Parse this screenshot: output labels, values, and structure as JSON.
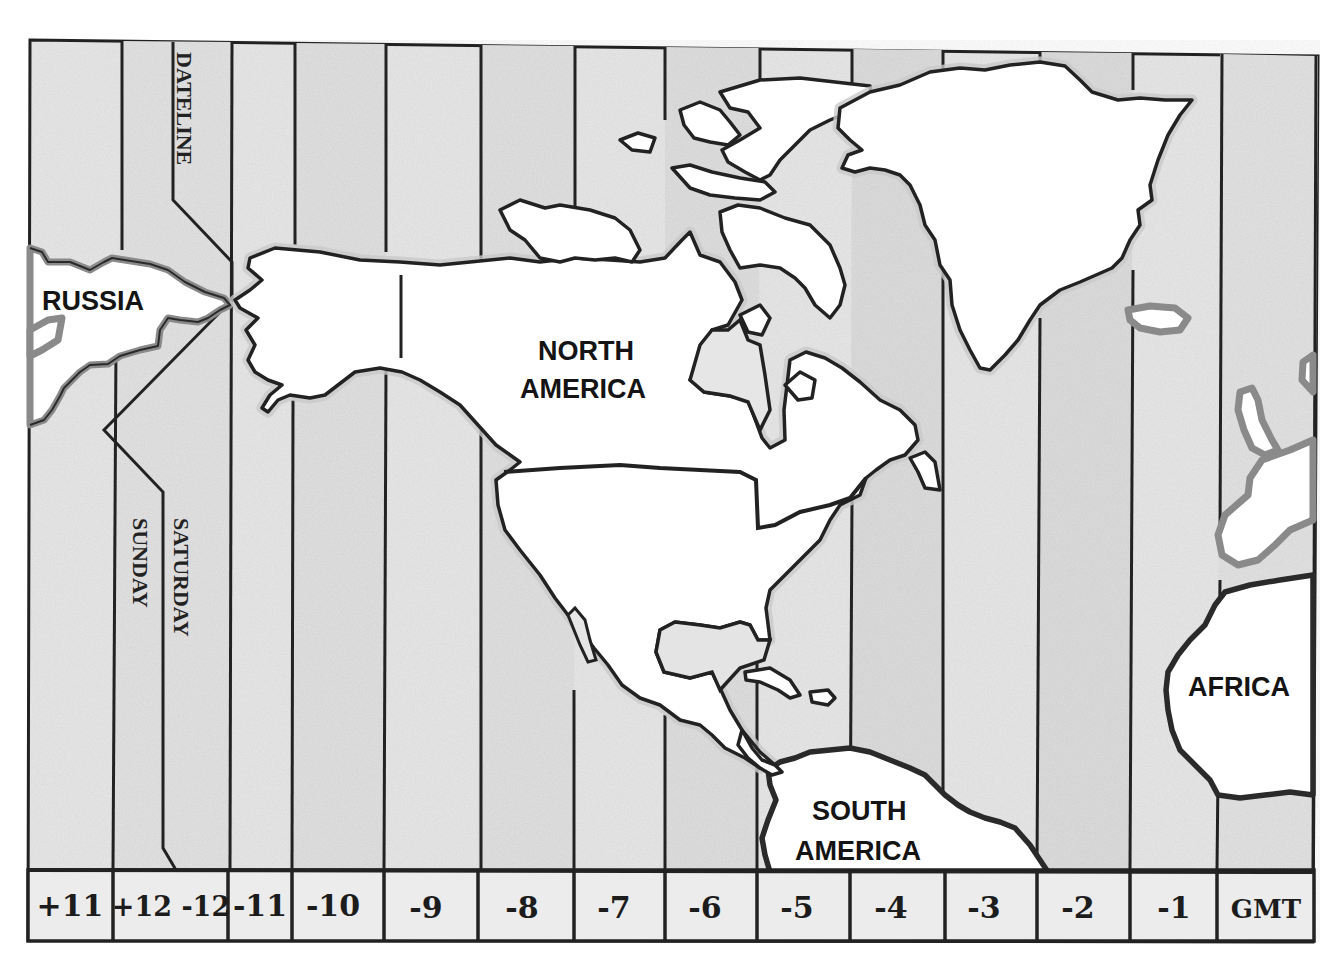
{
  "map": {
    "title_regions": {
      "russia": "RUSSIA",
      "north_america_line1": "NORTH",
      "north_america_line2": "AMERICA",
      "south_america_line1": "SOUTH",
      "south_america_line2": "AMERICA",
      "africa": "AFRICA"
    },
    "dateline_label": "DATELINE",
    "day_labels": {
      "west_of_line": "SUNDAY",
      "east_of_line": "SATURDAY"
    },
    "time_zones": [
      {
        "label": "+11"
      },
      {
        "label": "+12 -12"
      },
      {
        "label": "-11"
      },
      {
        "label": "-10"
      },
      {
        "label": "-9"
      },
      {
        "label": "-8"
      },
      {
        "label": "-7"
      },
      {
        "label": "-6"
      },
      {
        "label": "-5"
      },
      {
        "label": "-4"
      },
      {
        "label": "-3"
      },
      {
        "label": "-2"
      },
      {
        "label": "-1"
      },
      {
        "label": "GMT"
      }
    ],
    "colors": {
      "zone_fill_light": "#ececec",
      "zone_fill_dark": "#dcdcdc",
      "land": "#ffffff",
      "line": "#222222"
    }
  }
}
